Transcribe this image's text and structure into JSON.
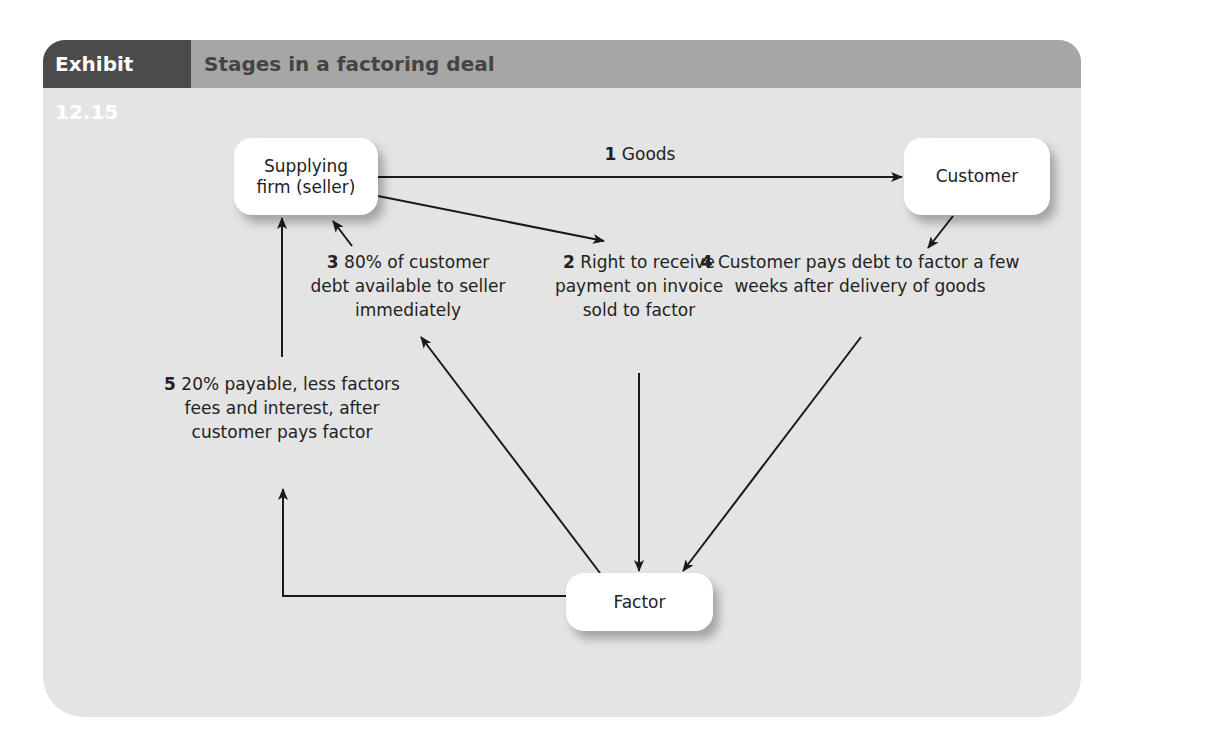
{
  "exhibit": {
    "number_label": "Exhibit 12.15",
    "title": "Stages in a factoring deal"
  },
  "nodes": {
    "seller": "Supplying firm (seller)",
    "customer": "Customer",
    "factor": "Factor"
  },
  "steps": [
    {
      "num": "1",
      "text": "Goods"
    },
    {
      "num": "2",
      "text": "Right to receive payment on invoice sold to factor"
    },
    {
      "num": "3",
      "text": "80% of customer debt available to seller immediately"
    },
    {
      "num": "4",
      "text": "Customer pays debt to factor a few weeks after delivery of goods"
    },
    {
      "num": "5",
      "text": "20% payable, less factors fees and interest, after customer pays factor"
    }
  ],
  "colors": {
    "header_dark": "#4b4b4b",
    "header_light": "#a6a6a6",
    "panel_bg": "#e4e4e4",
    "node_bg": "#ffffff",
    "line": "#1a1a1a"
  }
}
